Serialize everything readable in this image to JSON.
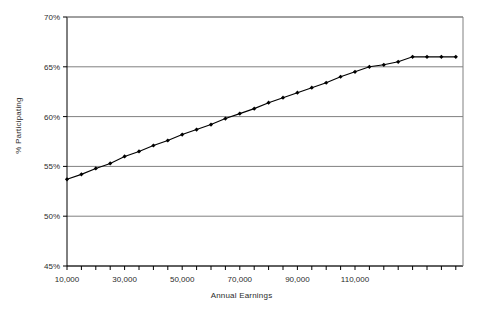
{
  "chart_data": {
    "type": "line",
    "title": "",
    "xlabel": "Annual Earnings",
    "ylabel": "% Participating",
    "xlim": [
      10000,
      147500
    ],
    "ylim": [
      45,
      70
    ],
    "ytick_values": [
      45,
      50,
      55,
      60,
      65,
      70
    ],
    "ytick_labels": [
      "45%",
      "50%",
      "55%",
      "60%",
      "65%",
      "70%"
    ],
    "xtick_values": [
      10000,
      30000,
      50000,
      70000,
      90000,
      110000
    ],
    "xtick_labels": [
      "10,000",
      "30,000",
      "50,000",
      "70,000",
      "90,000",
      "110,000"
    ],
    "xtick_minor_step": 5000,
    "grid": "horizontal",
    "legend": "none",
    "marker": "diamond",
    "line_color": "#000000",
    "grid_color": "#808080",
    "axis_color": "#000000",
    "series": [
      {
        "name": "Participation Rate",
        "x": [
          10000,
          15000,
          20000,
          25000,
          30000,
          35000,
          40000,
          45000,
          50000,
          55000,
          60000,
          65000,
          70000,
          75000,
          80000,
          85000,
          90000,
          95000,
          100000,
          105000,
          110000,
          115000,
          120000,
          125000,
          130000,
          135000,
          140000,
          145000
        ],
        "values": [
          53.7,
          54.2,
          54.8,
          55.3,
          56.0,
          56.5,
          57.1,
          57.6,
          58.2,
          58.7,
          59.2,
          59.8,
          60.3,
          60.8,
          61.4,
          61.9,
          62.4,
          62.9,
          63.4,
          64.0,
          64.5,
          65.0,
          65.2,
          65.5,
          66.0,
          66.0,
          66.0,
          66.0
        ]
      }
    ]
  },
  "axis_titles": {
    "x": "Annual Earnings",
    "y": "% Participating"
  }
}
